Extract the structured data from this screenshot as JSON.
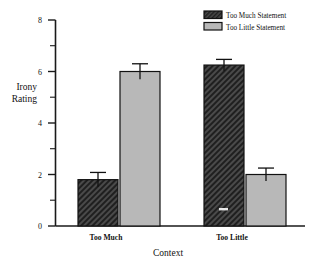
{
  "chart_data": {
    "type": "bar",
    "title": "",
    "xlabel": "Context",
    "ylabel": "Irony Rating",
    "ylabel_line1": "Irony",
    "ylabel_line2": "Rating",
    "categories": [
      "Too Much",
      "Too Little"
    ],
    "ylim": [
      0,
      8
    ],
    "yticks": [
      0,
      2,
      4,
      6,
      8
    ],
    "ytick_labels": [
      "0",
      "2",
      "4",
      "6",
      "8"
    ],
    "yminor_ticks": [
      1,
      3,
      5,
      7
    ],
    "grid": false,
    "legend_position": "top-right",
    "series": [
      {
        "name": "Too Much Statement",
        "values": [
          1.8,
          6.25
        ],
        "errors": [
          0.28,
          0.22
        ],
        "fill": "#3a3a3a",
        "pattern": "dense-hatch"
      },
      {
        "name": "Too Little Statement",
        "values": [
          6.0,
          2.0
        ],
        "errors": [
          0.3,
          0.25
        ],
        "fill": "#b8b8b8",
        "pattern": "solid-gray"
      }
    ]
  },
  "legend": {
    "entries": [
      {
        "label": "Too Much Statement",
        "swatch": "dense-hatch"
      },
      {
        "label": "Too Little Statement",
        "swatch": "solid-gray"
      }
    ]
  },
  "axes": {
    "y_title_line1": "Irony",
    "y_title_line2": "Rating",
    "x_title": "Context",
    "y_tick_8": "8",
    "y_tick_6": "6",
    "y_tick_4": "4",
    "y_tick_2": "2",
    "y_tick_0": "0",
    "x_cat_1": "Too Much",
    "x_cat_2": "Too Little"
  },
  "colors": {
    "axis": "#1a1a1a",
    "dark_bar": "#3a3a3a",
    "light_bar": "#b8b8b8",
    "background": "#ffffff"
  }
}
